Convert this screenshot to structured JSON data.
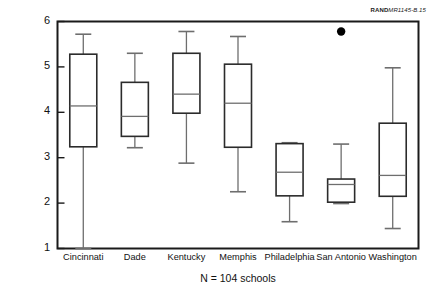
{
  "source_note": {
    "brand": "RAND",
    "code": "MR1145-B.15"
  },
  "chart_data": {
    "type": "box",
    "title": "",
    "subtitle": "",
    "xlabel": "N = 104 schools",
    "ylabel": "Student grouping is fluid, multi-age/year",
    "ylim": [
      1,
      6
    ],
    "yticks": [
      1,
      2,
      3,
      4,
      5,
      6
    ],
    "ytick_labels": [
      "1",
      "2",
      "3",
      "4",
      "5",
      "6"
    ],
    "grid": false,
    "legend": "none",
    "categories": [
      "Cincinnati",
      "Dade",
      "Kentucky",
      "Memphis",
      "Philadelphia",
      "San Antonio",
      "Washington"
    ],
    "boxes": [
      {
        "category": "Cincinnati",
        "whisker_low": 1.0,
        "q1": 3.24,
        "median": 4.14,
        "q3": 5.28,
        "whisker_high": 5.72,
        "outliers": []
      },
      {
        "category": "Dade",
        "whisker_low": 3.22,
        "q1": 3.47,
        "median": 3.91,
        "q3": 4.66,
        "whisker_high": 5.3,
        "outliers": []
      },
      {
        "category": "Kentucky",
        "whisker_low": 2.88,
        "q1": 3.98,
        "median": 4.4,
        "q3": 5.3,
        "whisker_high": 5.78,
        "outliers": []
      },
      {
        "category": "Memphis",
        "whisker_low": 2.25,
        "q1": 3.23,
        "median": 4.2,
        "q3": 5.06,
        "whisker_high": 5.67,
        "outliers": []
      },
      {
        "category": "Philadelphia",
        "whisker_low": 1.59,
        "q1": 2.16,
        "median": 2.68,
        "q3": 3.31,
        "whisker_high": 3.33,
        "outliers": []
      },
      {
        "category": "San Antonio",
        "whisker_low": 1.99,
        "q1": 2.02,
        "median": 2.41,
        "q3": 2.53,
        "whisker_high": 3.3,
        "outliers": [
          5.78
        ]
      },
      {
        "category": "Washington",
        "whisker_low": 1.44,
        "q1": 2.15,
        "median": 2.61,
        "q3": 3.76,
        "whisker_high": 4.98,
        "outliers": []
      }
    ],
    "colors": {
      "axis": "#1a1a1a",
      "box_stroke": "#2b2b2b",
      "box_fill": "#ffffff",
      "median": "#6e6e6e",
      "whisker": "#6e6e6e",
      "outlier": "#000000"
    }
  }
}
